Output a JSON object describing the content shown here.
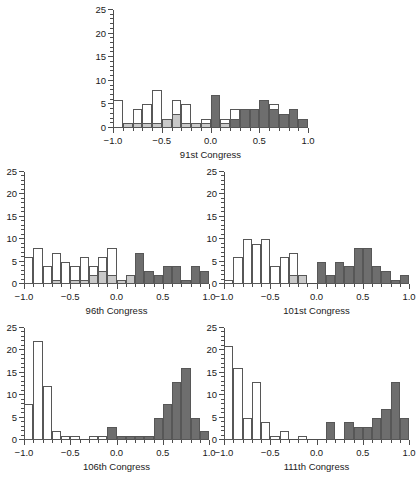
{
  "figure": {
    "bin_width": 0.1,
    "xlim": [
      -1.0,
      1.0
    ],
    "ylim": [
      0,
      25
    ],
    "x_ticks_major": [
      "-1.0",
      "-0.5",
      "0.0",
      "0.5",
      "1.0"
    ],
    "x_tick_values": [
      -1.0,
      -0.5,
      0.0,
      0.5,
      1.0
    ],
    "y_ticks_major": [
      "0",
      "5",
      "10",
      "15",
      "20",
      "25"
    ],
    "y_tick_values": [
      0,
      5,
      10,
      15,
      20,
      25
    ],
    "colors": {
      "white_bar": "#ffffff",
      "light_gray_bar": "#c9c9c9",
      "dark_gray_bar": "#6e6e6e",
      "bar_outline": "#575757",
      "axis": "#4d4d4d",
      "text": "#1a1a1a",
      "background": "#ffffff"
    }
  },
  "chart_data": [
    {
      "type": "bar",
      "title": "91st Congress",
      "xlabel": "",
      "ylabel": "",
      "xlim": [
        -1.0,
        1.0
      ],
      "ylim": [
        0,
        25
      ],
      "bin_width": 0.1,
      "grid": false,
      "legend": "none",
      "bin_starts": [
        -1.0,
        -0.9,
        -0.8,
        -0.7,
        -0.6,
        -0.5,
        -0.4,
        -0.3,
        -0.2,
        -0.1,
        0.0,
        0.1,
        0.2,
        0.3,
        0.4,
        0.5,
        0.6,
        0.7,
        0.8,
        0.9
      ],
      "series": [
        {
          "name": "white",
          "values": [
            6,
            0,
            4,
            5,
            8,
            2,
            6,
            5,
            1,
            2,
            0,
            2,
            4,
            4,
            4,
            4,
            5,
            0,
            0,
            0
          ]
        },
        {
          "name": "light-gray",
          "values": [
            0,
            1,
            1,
            1,
            1,
            2,
            3,
            1,
            1,
            1,
            3,
            1,
            1,
            1,
            2,
            2,
            4,
            3,
            0,
            0
          ]
        },
        {
          "name": "dark-gray",
          "values": [
            0,
            0,
            0,
            0,
            0,
            0,
            0,
            0,
            0,
            0,
            7,
            0,
            2,
            4,
            4,
            6,
            4,
            3,
            4,
            2
          ]
        }
      ]
    },
    {
      "type": "bar",
      "title": "96th Congress",
      "xlabel": "",
      "ylabel": "",
      "xlim": [
        -1.0,
        1.0
      ],
      "ylim": [
        0,
        25
      ],
      "bin_width": 0.1,
      "grid": false,
      "legend": "none",
      "bin_starts": [
        -1.0,
        -0.9,
        -0.8,
        -0.7,
        -0.6,
        -0.5,
        -0.4,
        -0.3,
        -0.2,
        -0.1,
        0.0,
        0.1,
        0.2,
        0.3,
        0.4,
        0.5,
        0.6,
        0.7,
        0.8,
        0.9
      ],
      "series": [
        {
          "name": "white",
          "values": [
            6,
            8,
            4,
            7,
            5,
            4,
            6,
            4,
            6,
            8,
            1,
            2,
            0,
            0,
            0,
            0,
            0,
            0,
            0,
            0
          ]
        },
        {
          "name": "light-gray",
          "values": [
            0,
            0,
            0,
            1,
            0,
            1,
            1,
            2,
            3,
            2,
            1,
            2,
            0,
            0,
            0,
            0,
            0,
            0,
            0,
            0
          ]
        },
        {
          "name": "dark-gray",
          "values": [
            0,
            0,
            0,
            0,
            0,
            0,
            0,
            0,
            0,
            0,
            0,
            0,
            7,
            3,
            2,
            4,
            4,
            1,
            4,
            3
          ]
        }
      ]
    },
    {
      "type": "bar",
      "title": "101st Congress",
      "xlabel": "",
      "ylabel": "",
      "xlim": [
        -1.0,
        1.0
      ],
      "ylim": [
        0,
        25
      ],
      "bin_width": 0.1,
      "grid": false,
      "legend": "none",
      "bin_starts": [
        -1.0,
        -0.9,
        -0.8,
        -0.7,
        -0.6,
        -0.5,
        -0.4,
        -0.3,
        -0.2,
        -0.1,
        0.0,
        0.1,
        0.2,
        0.3,
        0.4,
        0.5,
        0.6,
        0.7,
        0.8,
        0.9
      ],
      "series": [
        {
          "name": "white",
          "values": [
            1,
            6,
            10,
            9,
            10,
            4,
            6,
            7,
            2,
            0,
            0,
            0,
            0,
            0,
            0,
            0,
            0,
            0,
            0,
            0
          ]
        },
        {
          "name": "light-gray",
          "values": [
            0,
            0,
            0,
            0,
            0,
            0,
            0,
            2,
            2,
            0,
            1,
            0,
            0,
            0,
            0,
            0,
            0,
            0,
            0,
            0
          ]
        },
        {
          "name": "dark-gray",
          "values": [
            0,
            0,
            0,
            0,
            0,
            0,
            0,
            0,
            0,
            0,
            5,
            2,
            5,
            4,
            8,
            8,
            4,
            3,
            1,
            2
          ]
        }
      ]
    },
    {
      "type": "bar",
      "title": "106th Congress",
      "xlabel": "",
      "ylabel": "",
      "xlim": [
        -1.0,
        1.0
      ],
      "ylim": [
        0,
        25
      ],
      "bin_width": 0.1,
      "grid": false,
      "legend": "none",
      "bin_starts": [
        -1.0,
        -0.9,
        -0.8,
        -0.7,
        -0.6,
        -0.5,
        -0.4,
        -0.3,
        -0.2,
        -0.1,
        0.0,
        0.1,
        0.2,
        0.3,
        0.4,
        0.5,
        0.6,
        0.7,
        0.8,
        0.9
      ],
      "series": [
        {
          "name": "white",
          "values": [
            8,
            22,
            12,
            2,
            1,
            1,
            0,
            1,
            1,
            0,
            0,
            0,
            0,
            0,
            0,
            0,
            0,
            0,
            0,
            0
          ]
        },
        {
          "name": "light-gray",
          "values": [
            0,
            0,
            0,
            0,
            0,
            0,
            0,
            0,
            0,
            0,
            0,
            0,
            0,
            0,
            0,
            0,
            0,
            0,
            0,
            0
          ]
        },
        {
          "name": "dark-gray",
          "values": [
            0,
            0,
            0,
            0,
            0,
            0,
            0,
            0,
            0,
            3,
            1,
            1,
            1,
            1,
            5,
            8,
            13,
            16,
            5,
            2
          ]
        }
      ]
    },
    {
      "type": "bar",
      "title": "111th Congress",
      "xlabel": "",
      "ylabel": "",
      "xlim": [
        -1.0,
        1.0
      ],
      "ylim": [
        0,
        25
      ],
      "bin_width": 0.1,
      "grid": false,
      "legend": "none",
      "bin_starts": [
        -1.0,
        -0.9,
        -0.8,
        -0.7,
        -0.6,
        -0.5,
        -0.4,
        -0.3,
        -0.2,
        -0.1,
        0.0,
        0.1,
        0.2,
        0.3,
        0.4,
        0.5,
        0.6,
        0.7,
        0.8,
        0.9
      ],
      "series": [
        {
          "name": "white",
          "values": [
            21,
            16,
            5,
            13,
            4,
            1,
            2,
            0,
            1,
            0,
            0,
            0,
            0,
            0,
            0,
            0,
            0,
            0,
            0,
            0
          ]
        },
        {
          "name": "light-gray",
          "values": [
            0,
            0,
            0,
            0,
            0,
            0,
            0,
            0,
            0,
            0,
            0,
            0,
            0,
            0,
            0,
            0,
            0,
            0,
            0,
            0
          ]
        },
        {
          "name": "dark-gray",
          "values": [
            0,
            0,
            0,
            0,
            0,
            0,
            0,
            0,
            0,
            0,
            0,
            4,
            0,
            4,
            3,
            3,
            5,
            7,
            13,
            5
          ]
        }
      ]
    }
  ],
  "panels": [
    {
      "caption": "91st Congress"
    },
    {
      "caption": "96th Congress"
    },
    {
      "caption": "101st Congress"
    },
    {
      "caption": "106th Congress"
    },
    {
      "caption": "111th Congress"
    }
  ]
}
